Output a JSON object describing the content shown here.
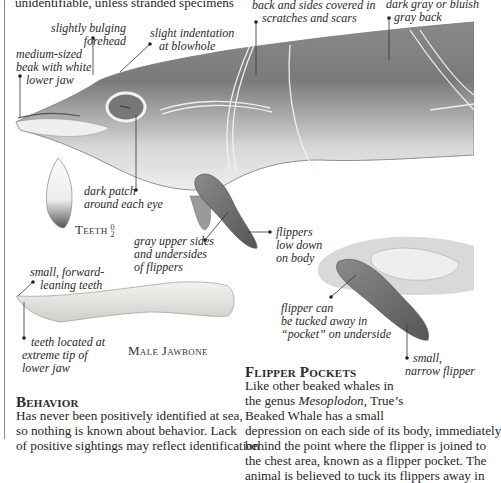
{
  "top_text": "unidentifiable, unless stranded specimens",
  "annotations": {
    "forehead": [
      "slightly bulging",
      "forehead"
    ],
    "blowhole": [
      "slight indentation",
      "at blowhole"
    ],
    "beak": [
      "medium-sized",
      "beak with white",
      "lower jaw"
    ],
    "scratches": [
      "back and sides covered in",
      "scratches and scars"
    ],
    "back": [
      "dark gray or bluish",
      "gray back"
    ],
    "eye_patch": [
      "dark patch",
      "around each eye"
    ],
    "flipper_color": [
      "gray upper sides",
      "and undersides",
      "of flippers"
    ],
    "flipper_position": [
      "flippers",
      "low down",
      "on body"
    ],
    "forward_teeth": [
      "small, forward-",
      "leaning teeth"
    ],
    "teeth_tip": [
      "teeth located at",
      "extreme tip of",
      "lower jaw"
    ],
    "pocket": [
      "flipper can",
      "be tucked away in",
      "“pocket” on underside"
    ],
    "narrow_flipper": [
      "small,",
      "narrow flipper"
    ]
  },
  "teeth_caption": "Teeth",
  "teeth_fraction": {
    "top": "0",
    "bottom": "2"
  },
  "jawbone_caption": "Male Jawbone",
  "flipper_pockets": {
    "heading": "Flipper Pockets",
    "lines": [
      "Like other beaked whales in",
      "the genus",
      "Mesoplodon",
      ", True’s",
      "Beaked Whale has a small",
      "depression on each side of its body, immediately",
      "behind the point where the flipper is joined to",
      "the chest area, known as a flipper pocket. The",
      "animal is believed to tuck its flippers away in"
    ]
  },
  "behavior": {
    "heading": "Behavior",
    "lines": [
      "Has never been positively identified at sea,",
      "so nothing is known about behavior. Lack",
      "of positive sightings may reflect identification"
    ]
  },
  "colors": {
    "text": "#262626",
    "whale_dark": "#7d7d7d",
    "whale_light": "#e6e6e6",
    "flipper": "#6f6f6f"
  }
}
